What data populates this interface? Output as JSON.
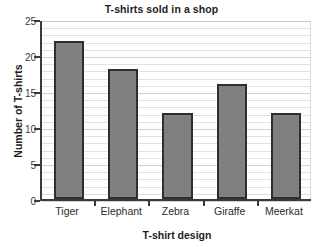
{
  "chart_data": {
    "type": "bar",
    "title": "T-shirts sold in a shop",
    "xlabel": "T-shirt design",
    "ylabel": "Number of T-shirts",
    "categories": [
      "Tiger",
      "Elephant",
      "Zebra",
      "Giraffe",
      "Meerkat"
    ],
    "values": [
      22,
      18,
      12,
      16,
      12
    ],
    "ylim": [
      0,
      25
    ],
    "ytick_labels": [
      "0",
      "5",
      "10",
      "15",
      "20",
      "25"
    ],
    "ytick_values": [
      0,
      5,
      10,
      15,
      20,
      25
    ],
    "y_major_step": 5,
    "y_minor_step": 1,
    "grid": true,
    "grid_axis": "y",
    "legend": "none",
    "bar_fill_color": "#808080",
    "bar_border_color": "#2e2e2e",
    "axis_color": "#3a3a3a",
    "gridline_color": "#e2e2e2",
    "background_color": "#ffffff"
  }
}
